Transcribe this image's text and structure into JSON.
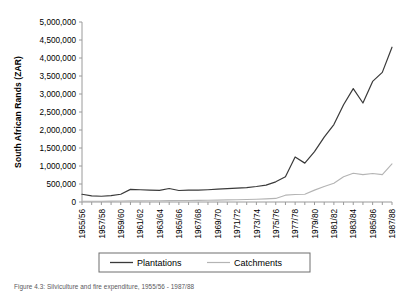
{
  "figure": {
    "caption": "Figure 4.3: Silviculture and fire expenditure, 1955/56 - 1987/88"
  },
  "chart_data": {
    "type": "line",
    "title": "",
    "xlabel": "",
    "ylabel": "South African Rands (ZAR)",
    "ylim": [
      0,
      5000000
    ],
    "ytick_labels": [
      "5,000,000",
      "4,500,000",
      "4,000,000",
      "3,500,000",
      "3,000,000",
      "2,500,000",
      "2,000,000",
      "1,500,000",
      "1,000,000",
      "500,000",
      "0"
    ],
    "ytick_values": [
      5000000,
      4500000,
      4000000,
      3500000,
      3000000,
      2500000,
      2000000,
      1500000,
      1000000,
      500000,
      0
    ],
    "grid": false,
    "legend_position": "bottom",
    "x": [
      "1955/56",
      "1956/57",
      "1957/58",
      "1958/59",
      "1959/60",
      "1960/61",
      "1961/62",
      "1962/63",
      "1963/64",
      "1964/65",
      "1965/66",
      "1966/67",
      "1967/68",
      "1968/69",
      "1969/70",
      "1970/71",
      "1971/72",
      "1972/73",
      "1973/74",
      "1974/75",
      "1975/76",
      "1976/77",
      "1977/78",
      "1978/79",
      "1979/80",
      "1980/81",
      "1981/82",
      "1982/83",
      "1983/84",
      "1984/85",
      "1985/86",
      "1986/87",
      "1987/88"
    ],
    "xtick_labels": [
      "1955/56",
      "1957/58",
      "1959/60",
      "1961/62",
      "1963/64",
      "1965/66",
      "1967/68",
      "1969/70",
      "1971/72",
      "1973/74",
      "1975/76",
      "1977/78",
      "1979/80",
      "1981/82",
      "1983/84",
      "1985/86",
      "1987/88"
    ],
    "series": [
      {
        "name": "Plantations",
        "color": "#3a3a3a",
        "values": [
          215000,
          170000,
          160000,
          175000,
          215000,
          350000,
          340000,
          330000,
          325000,
          375000,
          320000,
          330000,
          330000,
          340000,
          355000,
          370000,
          385000,
          400000,
          430000,
          470000,
          560000,
          700000,
          1250000,
          1080000,
          1400000,
          1800000,
          2150000,
          2700000,
          3150000,
          2750000,
          3350000,
          3600000,
          4300000
        ]
      },
      {
        "name": "Catchments",
        "color": "#b4b4b4",
        "values": [
          20000,
          20000,
          22000,
          24000,
          28000,
          30000,
          32000,
          34000,
          36000,
          38000,
          40000,
          42000,
          45000,
          48000,
          52000,
          58000,
          64000,
          70000,
          78000,
          88000,
          100000,
          190000,
          210000,
          215000,
          330000,
          430000,
          520000,
          700000,
          800000,
          760000,
          790000,
          760000,
          1060000
        ]
      }
    ]
  },
  "legend": {
    "items": [
      {
        "label": "Plantations"
      },
      {
        "label": "Catchments"
      }
    ]
  }
}
